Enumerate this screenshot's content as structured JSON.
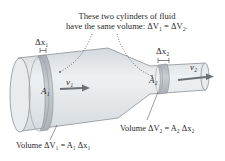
{
  "diagram": {
    "caption_line1": "These two cylinders of fluid",
    "caption_line2": "have the same volume: ΔV₁ = ΔV₂.",
    "dx1_label": "Δx₁",
    "dx2_label": "Δx₂",
    "v1_label": "v₁",
    "v2_label": "v₂",
    "A1_label": "A₁",
    "A2_label": "A₂",
    "volume1_label": "Volume ΔV₁ = A₁ Δx₁",
    "volume2_label": "Volume ΔV₂ = A₂ Δx₂"
  },
  "colors": {
    "pipe_fill": "#dfe3e6",
    "pipe_light": "#eef1f3",
    "pipe_stroke": "#8a9096",
    "band_fill": "#b9bfc4",
    "arrow": "#6b7176",
    "leader": "#555a5e"
  }
}
